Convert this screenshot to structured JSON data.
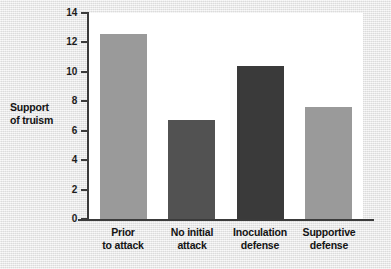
{
  "chart_data": {
    "type": "bar",
    "title": "",
    "xlabel": "",
    "ylabel": "Support of truism",
    "ylabel_lines": [
      "Support",
      "of truism"
    ],
    "ylim": [
      0,
      14
    ],
    "yticks": [
      0,
      2,
      4,
      6,
      8,
      10,
      12,
      14
    ],
    "ytick_labels": [
      "0",
      "2",
      "4",
      "6",
      "8",
      "10",
      "12",
      "14"
    ],
    "grid": false,
    "legend": "none",
    "categories": [
      "Prior to attack",
      "No initial attack",
      "Inoculation defense",
      "Supportive defense"
    ],
    "category_lines": [
      [
        "Prior",
        "to attack"
      ],
      [
        "No initial",
        "attack"
      ],
      [
        "Inoculation",
        "defense"
      ],
      [
        "Supportive",
        "defense"
      ]
    ],
    "values": [
      12.6,
      6.7,
      10.4,
      7.6
    ],
    "bar_colors": [
      "#9a9a9a",
      "#525252",
      "#3a3a3a",
      "#9a9a9a"
    ]
  },
  "colors": {
    "page_background": "#e9e9e9",
    "plot_background": "#ffffff",
    "axis": "#3b3b3b",
    "text": "#141414"
  }
}
